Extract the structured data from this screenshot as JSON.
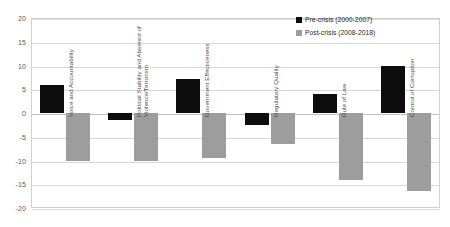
{
  "chart_data": {
    "type": "bar",
    "title": "",
    "xlabel": "",
    "ylabel": "",
    "ylim": [
      -20,
      20
    ],
    "grid": true,
    "legend_position": "top-right",
    "categories": [
      "Voice and Accountability",
      "Political Stability and Absence of Violence/Terrorism",
      "Government Effectiveness",
      "Regulatory Quality",
      "Rule of Law",
      "Control of Corruption"
    ],
    "series": [
      {
        "name": "Pre-crisis (2000-2007)",
        "color": "#0d0d0d",
        "values": [
          6.0,
          -1.5,
          7.1,
          -2.5,
          3.9,
          9.9
        ]
      },
      {
        "name": "Post-crisis (2008-2018)",
        "color": "#9d9d9d",
        "values": [
          -10.2,
          -10.0,
          -9.5,
          -6.5,
          -14.0,
          -16.5
        ]
      }
    ],
    "y_ticks": [
      20,
      15,
      10,
      5,
      0,
      -5,
      -10,
      -15,
      -20
    ],
    "y_tick_labels": [
      "20",
      "15",
      "10",
      "5",
      "0",
      "-5",
      "-10",
      "-15",
      "-20"
    ]
  },
  "legend": {
    "items": [
      {
        "label": "Pre-crisis (2000-2007)",
        "swatch": "pre"
      },
      {
        "label": "Post-crisis (2008-2018)",
        "swatch": "post"
      }
    ]
  },
  "category_labels": [
    {
      "lines": [
        "Voice and Accountability"
      ]
    },
    {
      "lines": [
        "Political Stability and Absence of",
        "Violence/Terrorism"
      ]
    },
    {
      "lines": [
        "Government Effectiveness"
      ]
    },
    {
      "lines": [
        "Regulatory Quality"
      ]
    },
    {
      "lines": [
        "Rule of Law"
      ]
    },
    {
      "lines": [
        "Control of Corruption"
      ]
    }
  ]
}
